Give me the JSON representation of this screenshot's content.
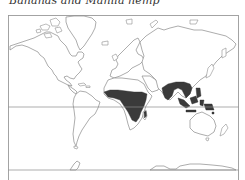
{
  "map": {
    "title": "Bananas and Manila hemp",
    "projection": "Mercator world outline",
    "colors": {
      "background": "#ffffff",
      "outline": "#8a8a8a",
      "shaded_region": "#3a3a3a",
      "title_text": "#333333"
    },
    "legend_meaning": "Dark shading = growing regions",
    "shaded_regions": [
      {
        "name": "Tropical Africa",
        "description": "West/Central Africa band south to southern tropics"
      },
      {
        "name": "Madagascar (east coast)",
        "description": "Small strip"
      },
      {
        "name": "South & Southeast Asia",
        "description": "India, Bangladesh, Indochina, southern China"
      },
      {
        "name": "Maritime Southeast Asia",
        "description": "Indonesia, Philippines, New Guinea"
      }
    ],
    "reference_lines": [
      {
        "name": "equator",
        "y_px": 107
      },
      {
        "name": "bottom-parallel",
        "y_px": 170
      }
    ]
  }
}
